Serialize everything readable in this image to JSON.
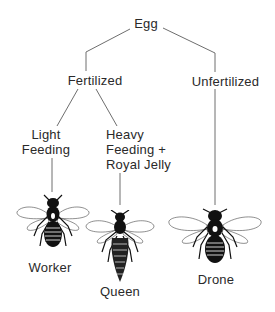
{
  "diagram": {
    "root": {
      "label": "Egg"
    },
    "branches": [
      {
        "label": "Fertilized",
        "children": [
          {
            "condition_line1": "Light",
            "condition_line2": "Feeding",
            "result": "Worker"
          },
          {
            "condition_line1": "Heavy",
            "condition_line2": "Feeding +",
            "condition_line3": "Royal Jelly",
            "result": "Queen"
          }
        ]
      },
      {
        "label": "Unfertilized",
        "children": [
          {
            "result": "Drone"
          }
        ]
      }
    ],
    "icons": [
      "worker-bee-icon",
      "queen-bee-icon",
      "drone-bee-icon"
    ],
    "colors": {
      "line": "#6e6e6e",
      "text": "#2a2a2a",
      "bee": "#111111"
    }
  }
}
